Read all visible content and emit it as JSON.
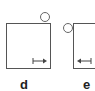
{
  "panels": [
    {
      "id": "d",
      "label": "d",
      "arrow_direction": "right"
    },
    {
      "id": "e",
      "label": "e",
      "arrow_direction": "left"
    }
  ],
  "colors": {
    "line": "#555555",
    "background": "#ffffff"
  }
}
